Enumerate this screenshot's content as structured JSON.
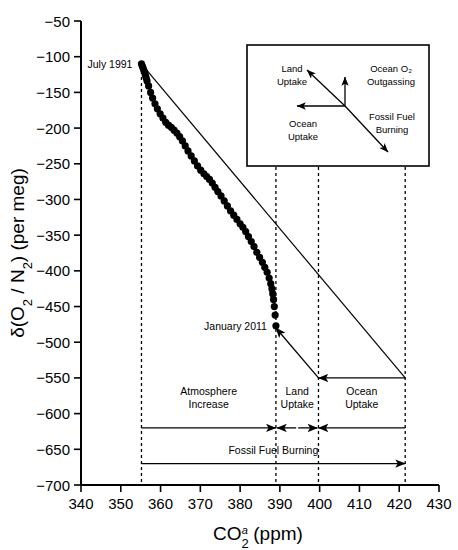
{
  "chart_data": {
    "type": "scatter",
    "title": "",
    "xlabel": "CO2a (ppm)",
    "xlabel_parts": {
      "base": "CO",
      "sub": "2",
      "sup": "a",
      "suffix": " (ppm)"
    },
    "ylabel": "δ(O2 / N2) (per meg)",
    "ylabel_parts": {
      "delta": "δ(O",
      "sub1": "2",
      "slash": " / N",
      "sub2": "2",
      "suffix": ") (per meg)"
    },
    "xlim": [
      340,
      430
    ],
    "ylim": [
      -700,
      -50
    ],
    "xticks": [
      340,
      350,
      360,
      370,
      380,
      390,
      400,
      410,
      420,
      430
    ],
    "xtick_labels": [
      "340",
      "350",
      "360",
      "370",
      "380",
      "390",
      "400",
      "410",
      "420",
      "430"
    ],
    "yticks": [
      -50,
      -100,
      -150,
      -200,
      -250,
      -300,
      -350,
      -400,
      -450,
      -500,
      -550,
      -600,
      -650,
      -700
    ],
    "ytick_labels": [
      "−50",
      "−100",
      "−150",
      "−200",
      "−250",
      "−300",
      "−350",
      "−400",
      "−450",
      "−500",
      "−550",
      "−600",
      "−650",
      "−700"
    ],
    "grid": false,
    "legend_position": "inset-upper-right",
    "series": [
      {
        "name": "Observed atmospheric CO2 vs delta(O2/N2)",
        "marker": "filled-circle",
        "color": "#000000",
        "points": [
          [
            355.2,
            -110
          ],
          [
            355.4,
            -113
          ],
          [
            355.6,
            -116
          ],
          [
            355.8,
            -119
          ],
          [
            356.0,
            -122
          ],
          [
            356.2,
            -126
          ],
          [
            356.4,
            -130
          ],
          [
            356.6,
            -134
          ],
          [
            357.0,
            -141
          ],
          [
            357.5,
            -150
          ],
          [
            358.0,
            -158
          ],
          [
            358.6,
            -166
          ],
          [
            359.2,
            -173
          ],
          [
            359.9,
            -180
          ],
          [
            360.6,
            -186
          ],
          [
            361.3,
            -192
          ],
          [
            362.0,
            -196
          ],
          [
            362.7,
            -199
          ],
          [
            363.4,
            -203
          ],
          [
            364.1,
            -207
          ],
          [
            364.8,
            -212
          ],
          [
            365.5,
            -218
          ],
          [
            366.2,
            -225
          ],
          [
            366.9,
            -232
          ],
          [
            367.7,
            -239
          ],
          [
            368.5,
            -246
          ],
          [
            369.3,
            -253
          ],
          [
            370.1,
            -259
          ],
          [
            370.9,
            -264
          ],
          [
            371.6,
            -268
          ],
          [
            372.3,
            -272
          ],
          [
            373.0,
            -277
          ],
          [
            373.7,
            -283
          ],
          [
            374.4,
            -289
          ],
          [
            375.2,
            -295
          ],
          [
            376.0,
            -302
          ],
          [
            376.8,
            -309
          ],
          [
            377.6,
            -316
          ],
          [
            378.4,
            -322
          ],
          [
            379.2,
            -328
          ],
          [
            380.0,
            -334
          ],
          [
            380.7,
            -339
          ],
          [
            381.4,
            -345
          ],
          [
            382.1,
            -352
          ],
          [
            382.8,
            -359
          ],
          [
            383.5,
            -366
          ],
          [
            384.2,
            -374
          ],
          [
            384.9,
            -381
          ],
          [
            385.6,
            -388
          ],
          [
            386.2,
            -395
          ],
          [
            386.8,
            -402
          ],
          [
            387.3,
            -410
          ],
          [
            387.7,
            -418
          ],
          [
            388.0,
            -425
          ],
          [
            388.2,
            -432
          ],
          [
            388.4,
            -440
          ],
          [
            388.6,
            -450
          ],
          [
            388.8,
            -462
          ],
          [
            389.0,
            -477
          ]
        ]
      }
    ],
    "reference_line": {
      "name": "Fossil fuel burning ratio line",
      "from": [
        355.2,
        -110
      ],
      "to": [
        421.5,
        -550
      ],
      "style": "solid"
    },
    "point_labels": [
      {
        "text": "July 1991",
        "x": 355.2,
        "y": -110,
        "anchor": "left-of-point"
      },
      {
        "text": "January 2011",
        "x": 389.0,
        "y": -477,
        "anchor": "left-of-point"
      }
    ],
    "vertical_markers": [
      {
        "x": 355.2,
        "label": "start"
      },
      {
        "x": 389.0,
        "label": "january-2011"
      },
      {
        "x": 399.7,
        "label": "land-uptake-boundary"
      },
      {
        "x": 421.5,
        "label": "fossil-fuel-total"
      }
    ],
    "budget_annotations": [
      {
        "id": "atmosphere-increase",
        "label_line1": "Atmosphere",
        "label_line2": "Increase",
        "from_x": 355.2,
        "to_x": 389.0,
        "y": -620,
        "arrow": "right"
      },
      {
        "id": "land-uptake",
        "label_line1": "Land",
        "label_line2": "Uptake",
        "from_x": 389.0,
        "to_x": 399.7,
        "y": -620,
        "arrow": "both-inward"
      },
      {
        "id": "ocean-uptake",
        "label_line1": "Ocean",
        "label_line2": "Uptake",
        "from_x": 421.5,
        "to_x": 399.7,
        "y": -620,
        "arrow": "left"
      },
      {
        "id": "fossil-fuel-burning",
        "label_line1": "Fossil Fuel Burning",
        "label_line2": "",
        "from_x": 355.2,
        "to_x": 421.5,
        "y": -670,
        "arrow": "right"
      }
    ],
    "flux_arrows": [
      {
        "id": "land-uptake-flux",
        "from": [
          399.7,
          -550
        ],
        "to": [
          389.0,
          -480
        ]
      },
      {
        "id": "ocean-uptake-flux",
        "from": [
          421.5,
          -550
        ],
        "to": [
          399.7,
          -550
        ]
      }
    ],
    "inset": {
      "x_range": [
        396,
        430
      ],
      "y_range": [
        -60,
        -185
      ],
      "labels": [
        {
          "id": "land-uptake",
          "line1": "Land",
          "line2": "Uptake"
        },
        {
          "id": "ocean-o2-outgassing",
          "line1": "Ocean O₂",
          "line2": "Outgassing"
        },
        {
          "id": "ocean-uptake",
          "line1": "Ocean",
          "line2": "Uptake"
        },
        {
          "id": "fossil-fuel-burning",
          "line1": "Fossil Fuel",
          "line2": "Burning"
        }
      ],
      "vectors": [
        {
          "id": "land-uptake-fossil-fuel-axis",
          "type": "double-headed-diagonal"
        },
        {
          "id": "ocean-o2-outgassing-axis",
          "type": "single-headed-up"
        },
        {
          "id": "ocean-uptake-axis",
          "type": "single-headed-left"
        }
      ]
    }
  }
}
